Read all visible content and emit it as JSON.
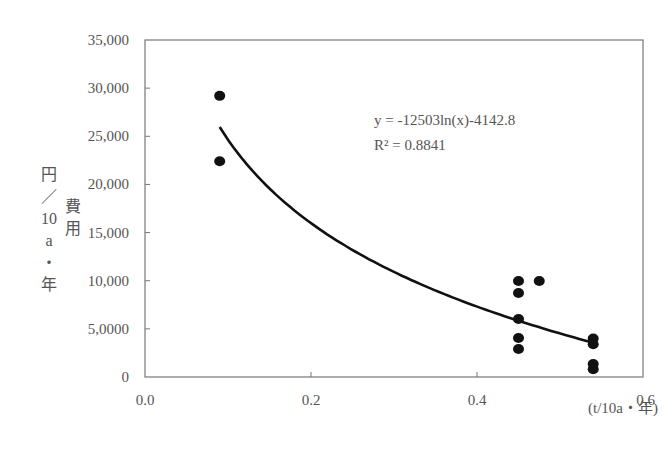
{
  "chart_data": {
    "type": "scatter",
    "title": "",
    "xlabel": "(t/10a・年)",
    "ylabel_columns": [
      [
        "円",
        "／",
        "10",
        "a",
        "・",
        "年"
      ],
      [
        "費",
        "用"
      ]
    ],
    "xlim": [
      0.0,
      0.6
    ],
    "ylim": [
      0,
      35000
    ],
    "x_ticks": [
      0.0,
      0.2,
      0.4,
      0.6
    ],
    "x_tick_labels": [
      "0.0",
      "0.2",
      "0.4",
      "0.6"
    ],
    "y_ticks": [
      0,
      5000,
      10000,
      15000,
      20000,
      25000,
      30000,
      35000
    ],
    "y_tick_labels": [
      "0",
      "5,0000",
      "10,000",
      "15,000",
      "20,000",
      "25,000",
      "30,000",
      "35,000"
    ],
    "grid": false,
    "series": [
      {
        "name": "observed",
        "marker": "circle",
        "color": "#111111",
        "points": [
          {
            "x": 0.09,
            "y": 29200
          },
          {
            "x": 0.09,
            "y": 22400
          },
          {
            "x": 0.45,
            "y": 9970
          },
          {
            "x": 0.45,
            "y": 8720
          },
          {
            "x": 0.45,
            "y": 6020
          },
          {
            "x": 0.45,
            "y": 4050
          },
          {
            "x": 0.45,
            "y": 2900
          },
          {
            "x": 0.475,
            "y": 9970
          },
          {
            "x": 0.54,
            "y": 4000
          },
          {
            "x": 0.54,
            "y": 3400
          },
          {
            "x": 0.54,
            "y": 1350
          },
          {
            "x": 0.54,
            "y": 800
          }
        ]
      }
    ],
    "trendline": {
      "type": "logarithmic",
      "a": -12503,
      "b": -4142.8,
      "x_range": [
        0.09,
        0.54
      ],
      "color": "#111111"
    },
    "annotations": [
      "y = -12503ln(x)-4142.8",
      "R² = 0.8841"
    ]
  }
}
